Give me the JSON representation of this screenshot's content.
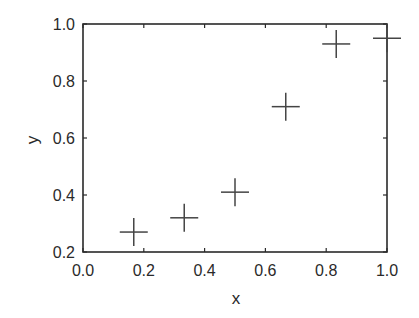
{
  "chart_data": {
    "type": "scatter",
    "title": "",
    "xlabel": "x",
    "ylabel": "y",
    "xlim": [
      0.0,
      1.0
    ],
    "ylim": [
      0.2,
      1.0
    ],
    "xticks": [
      "0.0",
      "0.2",
      "0.4",
      "0.6",
      "0.8",
      "1.0"
    ],
    "yticks": [
      "0.2",
      "0.4",
      "0.6",
      "0.8",
      "1.0"
    ],
    "grid": false,
    "legend": null,
    "marker": "plus",
    "series": [
      {
        "name": "data",
        "x": [
          0.167,
          0.333,
          0.5,
          0.667,
          0.833,
          1.0
        ],
        "y": [
          0.27,
          0.32,
          0.41,
          0.71,
          0.93,
          0.95
        ]
      }
    ]
  },
  "colors": {
    "axis": "#2a2a2a",
    "marker": "#444444"
  }
}
